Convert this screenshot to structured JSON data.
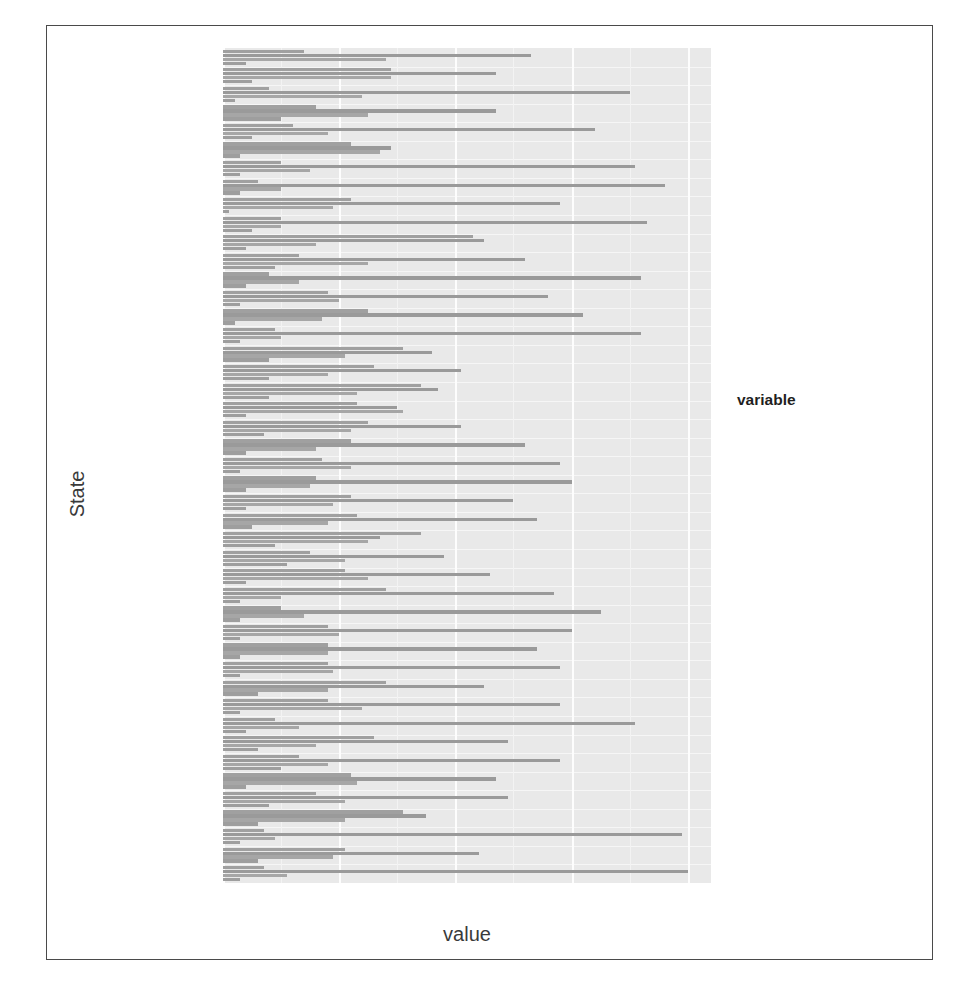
{
  "chart_data": {
    "type": "bar",
    "orientation": "horizontal",
    "grouped": true,
    "title": "",
    "xlabel": "value",
    "ylabel": "State",
    "xlim": [
      0,
      84
    ],
    "xticks": [
      0,
      20,
      40,
      60,
      80
    ],
    "xtick_labels": [
      "0",
      "20",
      "40",
      "60",
      "80"
    ],
    "grid": true,
    "legend_title": "variable",
    "legend_position": "right",
    "series_names": [
      "Catholic",
      "Protestant",
      "Non.religious",
      "Other"
    ],
    "series_colors": [
      "#a0a0a0",
      "#9a9a9a",
      "#a6a6a6",
      "#9e9e9e"
    ],
    "categories": [
      "Wyoming",
      "Wisconsin",
      "West Virginia",
      "Washington",
      "Virginia",
      "Vermont",
      "Utah",
      "Tennessee",
      "South Dakota",
      "South Carolina",
      "Rhode Island",
      "Oregon",
      "Oklahoma",
      "Ohio",
      "North Dakota",
      "North Carolina",
      "New York",
      "New Mexico",
      "New Jersey",
      "New Hampshire",
      "Nevada",
      "Nebraska",
      "Montana",
      "Missouri",
      "Minnesota",
      "Michigan",
      "Massachusetts",
      "Maryland",
      "Maine",
      "Louisiana",
      "Kentucky",
      "Kansas",
      "Iowa",
      "Indiana",
      "Illinois",
      "Idaho",
      "Georgia",
      "Florida",
      "District of Columbia",
      "Delaware",
      "Colorado",
      "California",
      "Arkansas",
      "Arizona",
      "Alabama"
    ],
    "series": [
      {
        "name": "Catholic",
        "values": [
          14,
          29,
          8,
          16,
          12,
          22,
          10,
          6,
          22,
          10,
          43,
          13,
          8,
          18,
          25,
          9,
          31,
          26,
          34,
          23,
          25,
          22,
          17,
          16,
          22,
          23,
          34,
          15,
          21,
          28,
          10,
          18,
          18,
          18,
          28,
          18,
          9,
          26,
          13,
          22,
          16,
          31,
          7,
          21,
          7
        ]
      },
      {
        "name": "Protestant",
        "values": [
          53,
          47,
          70,
          47,
          64,
          29,
          71,
          76,
          58,
          73,
          45,
          52,
          72,
          56,
          62,
          72,
          36,
          41,
          37,
          30,
          41,
          52,
          58,
          60,
          50,
          54,
          27,
          38,
          46,
          57,
          65,
          60,
          54,
          58,
          45,
          58,
          71,
          49,
          58,
          47,
          49,
          35,
          79,
          44,
          80
        ]
      },
      {
        "name": "Non.religious",
        "values": [
          28,
          29,
          24,
          25,
          18,
          27,
          15,
          10,
          19,
          10,
          16,
          25,
          13,
          20,
          17,
          10,
          21,
          18,
          23,
          31,
          22,
          16,
          22,
          15,
          19,
          18,
          25,
          21,
          25,
          10,
          14,
          20,
          18,
          19,
          18,
          24,
          13,
          16,
          18,
          23,
          21,
          21,
          9,
          19,
          11
        ]
      },
      {
        "name": "Other",
        "values": [
          4,
          5,
          2,
          10,
          5,
          3,
          3,
          3,
          1,
          5,
          4,
          9,
          4,
          3,
          2,
          3,
          8,
          8,
          8,
          4,
          7,
          4,
          3,
          4,
          4,
          5,
          9,
          11,
          4,
          3,
          3,
          3,
          3,
          3,
          6,
          3,
          4,
          6,
          10,
          4,
          8,
          6,
          3,
          6,
          3
        ]
      }
    ]
  },
  "axes": {
    "x_title": "value",
    "y_title": "State"
  },
  "legend": {
    "title": "variable",
    "items": [
      {
        "label": "Catholic",
        "color": "#a0a0a0",
        "key": "catholic"
      },
      {
        "label": "Protestant",
        "color": "#9a9a9a",
        "key": "protestant"
      },
      {
        "label": "Non.religious",
        "color": "#a6a6a6",
        "key": "nonreligious"
      },
      {
        "label": "Other",
        "color": "#9e9e9e",
        "key": "other"
      }
    ]
  }
}
